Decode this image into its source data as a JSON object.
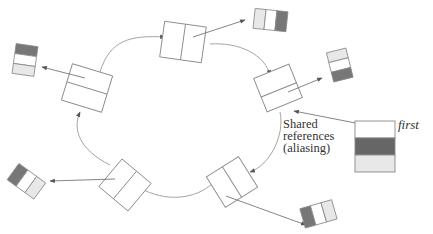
{
  "diagram": {
    "annotation_lines": [
      "Shared",
      "references",
      "(aliasing)"
    ],
    "variable_label": "first",
    "colors": {
      "stroke": "#888888",
      "arrow": "#555555",
      "dark": "#777777",
      "light": "#e8e8e8",
      "white": "#ffffff"
    },
    "nodes": 6,
    "elements": 6
  }
}
